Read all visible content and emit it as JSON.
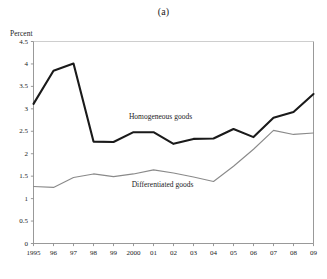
{
  "figure": {
    "title": "(a)",
    "axis_unit_label": "Percent"
  },
  "chart_data": {
    "type": "line",
    "title": "(a)",
    "xlabel": "",
    "ylabel": "Percent",
    "ylim": [
      0,
      4.5
    ],
    "ytick_labels": [
      "0",
      "0.5",
      "1",
      "1.5",
      "2",
      "2.5",
      "3",
      "3.5",
      "4",
      "4.5"
    ],
    "ytick_values": [
      0,
      0.5,
      1,
      1.5,
      2,
      2.5,
      3,
      3.5,
      4,
      4.5
    ],
    "grid": false,
    "legend_position": "inline-annotations",
    "categories": [
      "1995",
      "96",
      "97",
      "98",
      "99",
      "2000",
      "01",
      "02",
      "03",
      "04",
      "05",
      "06",
      "07",
      "08",
      "09"
    ],
    "x": [
      1995,
      1996,
      1997,
      1998,
      1999,
      2000,
      2001,
      2002,
      2003,
      2004,
      2005,
      2006,
      2007,
      2008,
      2009
    ],
    "series": [
      {
        "name": "Homogeneous goods",
        "color": "#1a1a1a",
        "width": 2.1,
        "values": [
          3.11,
          3.85,
          4.01,
          2.27,
          2.26,
          2.48,
          2.48,
          2.22,
          2.33,
          2.34,
          2.55,
          2.37,
          2.8,
          2.93,
          3.33
        ],
        "label": "Homogeneous goods",
        "label_x": 2001.35,
        "label_y": 2.83
      },
      {
        "name": "Differentiated goods",
        "color": "#8a8a8a",
        "width": 1.1,
        "values": [
          1.27,
          1.25,
          1.47,
          1.55,
          1.49,
          1.55,
          1.64,
          1.57,
          1.48,
          1.38,
          1.72,
          2.1,
          2.52,
          2.43,
          2.46
        ],
        "label": "Differentiated goods",
        "label_x": 2001.45,
        "label_y": 1.33
      }
    ]
  }
}
